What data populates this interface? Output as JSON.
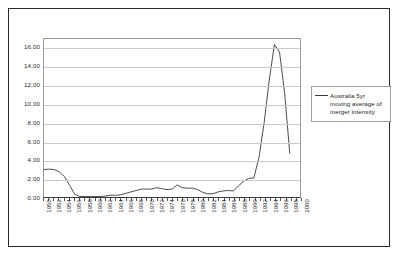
{
  "legend": {
    "position": "right",
    "entries": [
      {
        "label": "Australia 5yr moving average of merger intensity",
        "color": "#3a3a3a"
      }
    ]
  },
  "axes": {
    "y_ticks": [
      "0.00",
      "2.00",
      "4.00",
      "6.00",
      "8.00",
      "10.00",
      "12.00",
      "14.00",
      "16.00"
    ],
    "x_ticks": [
      "1950",
      "1952",
      "1954",
      "1956",
      "1958",
      "1960",
      "1962",
      "1964",
      "1966",
      "1968",
      "1970",
      "1972",
      "1974",
      "1976",
      "1978",
      "1980",
      "1982",
      "1984",
      "1986",
      "1988",
      "1990",
      "1992",
      "1994",
      "1996",
      "1998",
      "2000"
    ]
  },
  "chart_data": {
    "type": "line",
    "title": "",
    "subtitle": "",
    "xlabel": "",
    "ylabel": "",
    "xlim": [
      1950,
      2000
    ],
    "ylim": [
      0,
      17
    ],
    "grid": true,
    "legend_position": "right",
    "x_tick_step": 2,
    "y_tick_step": 2,
    "series": [
      {
        "name": "Australia 5yr moving average of merger intensity",
        "color": "#3a3a3a",
        "x": [
          1950,
          1951,
          1952,
          1953,
          1954,
          1955,
          1956,
          1957,
          1958,
          1959,
          1960,
          1961,
          1962,
          1963,
          1964,
          1965,
          1966,
          1967,
          1968,
          1969,
          1970,
          1971,
          1972,
          1973,
          1974,
          1975,
          1976,
          1977,
          1978,
          1979,
          1980,
          1981,
          1982,
          1983,
          1984,
          1985,
          1986,
          1987,
          1988,
          1989,
          1990,
          1991,
          1992,
          1993,
          1994,
          1995,
          1996,
          1997,
          1998
        ],
        "values": [
          2.95,
          3.0,
          2.95,
          2.7,
          2.2,
          1.25,
          0.3,
          0.05,
          0.05,
          0.05,
          0.05,
          0.05,
          0.1,
          0.2,
          0.18,
          0.25,
          0.4,
          0.55,
          0.7,
          0.85,
          0.85,
          0.85,
          1.0,
          0.9,
          0.8,
          0.85,
          1.3,
          1.0,
          0.95,
          0.95,
          0.8,
          0.5,
          0.35,
          0.35,
          0.55,
          0.65,
          0.7,
          0.65,
          1.2,
          1.7,
          2.0,
          2.05,
          4.3,
          8.0,
          12.6,
          16.4,
          15.6,
          11.2,
          4.7
        ]
      }
    ]
  }
}
